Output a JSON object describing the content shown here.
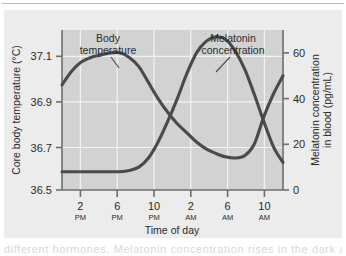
{
  "figure": {
    "name": "circadian-rhythm-chart",
    "panel_background": "#d2d2d2",
    "page_background": "#ececec",
    "curve_color": "#4a4a4a",
    "grid_color": "#f0f0f0",
    "axis_color": "#6e6e6e",
    "page_text_fragment": "different hormones. Melatonin concentration rises in the dark and"
  },
  "chart_data": {
    "type": "line",
    "title": "",
    "xlabel": "Time of day",
    "grid": true,
    "legend": "annotations-on-curves",
    "x_ticks": [
      {
        "hour": "2",
        "meridiem": "PM"
      },
      {
        "hour": "6",
        "meridiem": "PM"
      },
      {
        "hour": "10",
        "meridiem": "PM"
      },
      {
        "hour": "2",
        "meridiem": "AM"
      },
      {
        "hour": "6",
        "meridiem": "AM"
      },
      {
        "hour": "10",
        "meridiem": "AM"
      }
    ],
    "x_tick_labels": [
      "2 PM",
      "6 PM",
      "10 PM",
      "2 AM",
      "6 AM",
      "10 AM"
    ],
    "x": [
      13,
      14,
      15,
      16,
      17,
      18,
      19,
      20,
      21,
      22,
      23,
      24,
      25,
      26,
      27,
      28,
      29,
      30,
      31,
      32,
      33,
      34,
      35,
      36
    ],
    "axes": {
      "left": {
        "label": "Core body temperature (°C)",
        "unit": "°C",
        "ticks": [
          "37.1",
          "36.9",
          "36.7",
          "36.5"
        ],
        "tick_values": [
          37.1,
          36.9,
          36.7,
          36.5
        ],
        "range": [
          36.5,
          37.2
        ]
      },
      "right": {
        "label": "Melatonin concentration in blood (pg/mL)",
        "label_line1": "Melatonin concentration",
        "label_line2": "in blood (pg/mL)",
        "unit": "pg/mL",
        "ticks": [
          "60",
          "40",
          "20",
          "0"
        ],
        "tick_values": [
          60,
          40,
          20,
          0
        ],
        "range": [
          0,
          70
        ]
      }
    },
    "series": [
      {
        "name": "Body temperature",
        "axis": "left",
        "unit": "°C",
        "annotation": {
          "line1": "Body",
          "line2": "temperature"
        },
        "values": [
          36.96,
          37.02,
          37.06,
          37.08,
          37.09,
          37.1,
          37.1,
          37.08,
          37.04,
          36.97,
          36.9,
          36.84,
          36.79,
          36.75,
          36.71,
          36.68,
          36.66,
          36.645,
          36.64,
          36.65,
          36.7,
          36.82,
          36.92,
          37.0
        ],
        "peak": {
          "time": "6 PM",
          "value": 37.1
        },
        "trough": {
          "time": "5 AM",
          "value": 36.64
        }
      },
      {
        "name": "Melatonin concentration",
        "axis": "right",
        "unit": "pg/mL",
        "annotation": {
          "line1": "Melatonin",
          "line2": "concentration"
        },
        "values": [
          8,
          8,
          8,
          8,
          8,
          8,
          8,
          8.5,
          10,
          14,
          21,
          30,
          40,
          51,
          60,
          65,
          67,
          66,
          61,
          53,
          42,
          30,
          19,
          12
        ],
        "peak": {
          "time": "4 AM",
          "value": 67
        },
        "baseline": 8
      }
    ]
  }
}
